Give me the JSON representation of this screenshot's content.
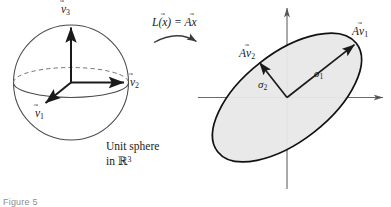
{
  "figure": {
    "caption": "Figure 5",
    "background_color": "#ffffff",
    "ink_color": "#1a1a1a"
  },
  "left_panel": {
    "name": "unit-sphere-domain",
    "shape": "sphere",
    "caption_line_1": "Unit sphere",
    "caption_line_2_prefix": "in ",
    "caption_line_2_space": "ℝ",
    "caption_line_2_dim": "3",
    "basis_vectors": [
      {
        "id": "v1",
        "letter": "v",
        "subscript": "1",
        "accent": "⃗",
        "direction": "down-left"
      },
      {
        "id": "v2",
        "letter": "v",
        "subscript": "2",
        "accent": "⃗",
        "direction": "right"
      },
      {
        "id": "v3",
        "letter": "v",
        "subscript": "3",
        "accent": "⃗",
        "direction": "up"
      }
    ]
  },
  "transformation": {
    "name": "linear-map",
    "label_L": "L",
    "label_open": "(",
    "label_x": "x",
    "label_close": ")",
    "label_equals": " = ",
    "label_A": "A",
    "label_x2": "x",
    "accent": "⃗",
    "arrow": "curved-right"
  },
  "right_panel": {
    "name": "image-ellipse-codomain",
    "shape": "ellipse",
    "fill_color": "#e8e8e8",
    "stroke_color": "#1a1a1a",
    "tilt_degrees": -38,
    "semi_major_px": 88,
    "semi_minor_px": 44,
    "axes": {
      "horizontal": "x-axis",
      "vertical": "y-axis",
      "origin_label": ""
    },
    "image_vectors": [
      {
        "id": "Av1",
        "prefix": "A",
        "letter": "v",
        "subscript": "1",
        "accent": "⃗",
        "singular_value": "σ",
        "singular_subscript": "1"
      },
      {
        "id": "Av2",
        "prefix": "A",
        "letter": "v",
        "subscript": "2",
        "accent": "⃗",
        "singular_value": "σ",
        "singular_subscript": "2"
      }
    ]
  }
}
